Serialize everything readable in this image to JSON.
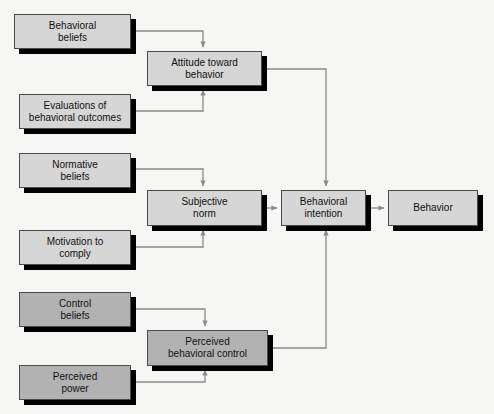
{
  "diagram": {
    "background_color": "#f6f6f4",
    "node_fill_light": "#d6d6d6",
    "node_fill_dark": "#b2b2b2",
    "node_border_color": "#4a4a4a",
    "shadow_color": "#000000",
    "edge_color": "#8a8a8a",
    "nodes": [
      {
        "id": "behavioral_beliefs",
        "label": "Behavioral\nbeliefs",
        "shade": "light",
        "x": 14,
        "y": 14,
        "w": 117,
        "h": 35
      },
      {
        "id": "evaluations",
        "label": "Evaluations of\nbehavioral outcomes",
        "shade": "light",
        "x": 19,
        "y": 94,
        "w": 112,
        "h": 35
      },
      {
        "id": "normative_beliefs",
        "label": "Normative\nbeliefs",
        "shade": "light",
        "x": 19,
        "y": 153,
        "w": 112,
        "h": 35
      },
      {
        "id": "motivation_to_comply",
        "label": "Motivation to\ncomply",
        "shade": "light",
        "x": 19,
        "y": 230,
        "w": 112,
        "h": 35
      },
      {
        "id": "control_beliefs",
        "label": "Control\nbeliefs",
        "shade": "dark",
        "x": 19,
        "y": 292,
        "w": 112,
        "h": 35
      },
      {
        "id": "perceived_power",
        "label": "Perceived\npower",
        "shade": "dark",
        "x": 19,
        "y": 365,
        "w": 112,
        "h": 35
      },
      {
        "id": "attitude",
        "label": "Attitude toward\nbehavior",
        "shade": "light",
        "x": 147,
        "y": 51,
        "w": 115,
        "h": 35
      },
      {
        "id": "subjective_norm",
        "label": "Subjective\nnorm",
        "shade": "light",
        "x": 147,
        "y": 190,
        "w": 115,
        "h": 36
      },
      {
        "id": "perceived_behavioral_control",
        "label": "Perceived\nbehavioral control",
        "shade": "dark",
        "x": 147,
        "y": 330,
        "w": 121,
        "h": 36
      },
      {
        "id": "behavioral_intention",
        "label": "Behavioral\nintention",
        "shade": "light",
        "x": 281,
        "y": 190,
        "w": 85,
        "h": 36
      },
      {
        "id": "behavior",
        "label": "Behavior",
        "shade": "light",
        "x": 388,
        "y": 190,
        "w": 90,
        "h": 36
      }
    ],
    "edges": [
      {
        "id": "behavioral_beliefs-to-attitude",
        "from": "behavioral_beliefs",
        "to": "attitude",
        "path": "M131,31 L203,31 L203,47"
      },
      {
        "id": "evaluations-to-attitude",
        "from": "evaluations",
        "to": "attitude",
        "path": "M131,111 L203,111 L203,90"
      },
      {
        "id": "normative_beliefs-to-subjnorm",
        "from": "normative_beliefs",
        "to": "subjective_norm",
        "path": "M131,169 L203,169 L203,186"
      },
      {
        "id": "motivation-to-subjnorm",
        "from": "motivation_to_comply",
        "to": "subjective_norm",
        "path": "M131,247 L203,247 L203,230"
      },
      {
        "id": "control_beliefs-to-pbc",
        "from": "control_beliefs",
        "to": "perceived_behavioral_control",
        "path": "M131,309 L205,309 L205,326"
      },
      {
        "id": "perceived_power-to-pbc",
        "from": "perceived_power",
        "to": "perceived_behavioral_control",
        "path": "M131,382 L205,382 L205,370"
      },
      {
        "id": "attitude-to-intention",
        "from": "attitude",
        "to": "behavioral_intention",
        "path": "M262,69 L326,69 L326,186"
      },
      {
        "id": "subjnorm-to-intention",
        "from": "subjective_norm",
        "to": "behavioral_intention",
        "path": "M262,208 L277,208"
      },
      {
        "id": "pbc-to-intention",
        "from": "perceived_behavioral_control",
        "to": "behavioral_intention",
        "path": "M268,348 L326,348 L326,230"
      },
      {
        "id": "intention-to-behavior",
        "from": "behavioral_intention",
        "to": "behavior",
        "path": "M366,208 L384,208"
      }
    ]
  }
}
